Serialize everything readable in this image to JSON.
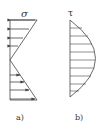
{
  "figure": {
    "panels": [
      {
        "id": "a",
        "caption": "a)",
        "symbol": "σ",
        "description": "Linear normal stress distribution: compression (arrows pointing left) above neutral axis, tension (arrows pointing right) below",
        "arrow_count_top": 4,
        "arrow_count_bottom": 4
      },
      {
        "id": "b",
        "caption": "b)",
        "symbol": "τ",
        "description": "Parabolic shear stress distribution with horizontal hatch lines, maximum at mid-height",
        "hatch_line_count": 9
      }
    ],
    "colors": {
      "line": "#444444",
      "background": "#ffffff"
    }
  }
}
